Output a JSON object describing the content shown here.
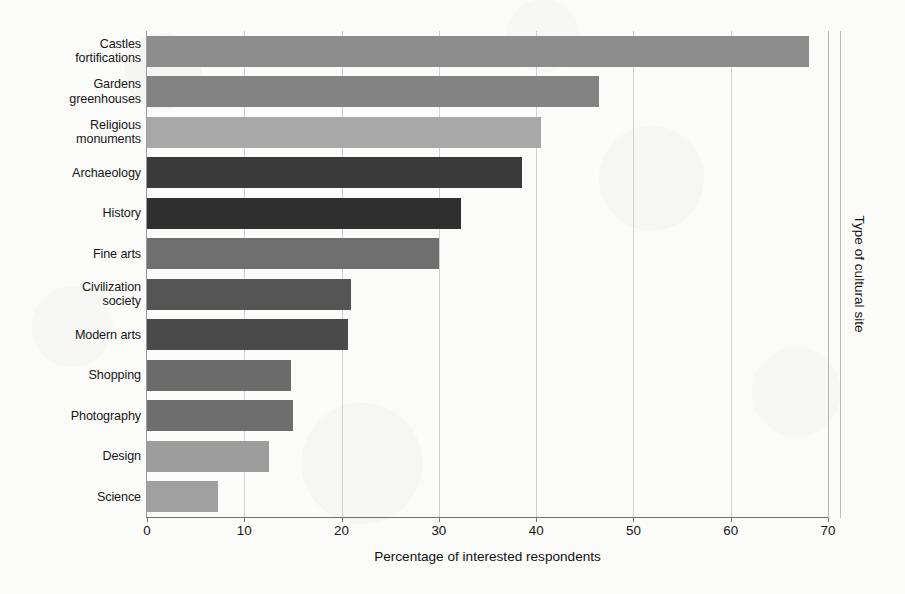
{
  "chart_data": {
    "type": "bar",
    "orientation": "horizontal",
    "title": "",
    "xlabel": "Percentage of interested respondents",
    "ylabel": "Type of cultural site",
    "xlim": [
      0,
      70
    ],
    "xticks": [
      0,
      10,
      20,
      30,
      40,
      50,
      60,
      70
    ],
    "xtick_labels": [
      "0",
      "10",
      "20",
      "30",
      "40",
      "50",
      "60",
      "70"
    ],
    "grid": true,
    "grid_axis": "x",
    "legend": false,
    "categories": [
      "Castles fortifications",
      "Gardens greenhouses",
      "Religious monuments",
      "Archaeology",
      "History",
      "Fine arts",
      "Civilization society",
      "Modern arts",
      "Shopping",
      "Photography",
      "Design",
      "Science"
    ],
    "category_lines": [
      [
        "Castles",
        "fortifications"
      ],
      [
        "Gardens",
        "greenhouses"
      ],
      [
        "Religious",
        "monuments"
      ],
      [
        "Archaeology"
      ],
      [
        "History"
      ],
      [
        "Fine arts"
      ],
      [
        "Civilization",
        "society"
      ],
      [
        "Modern arts"
      ],
      [
        "Shopping"
      ],
      [
        "Photography"
      ],
      [
        "Design"
      ],
      [
        "Science"
      ]
    ],
    "values": [
      68.0,
      46.5,
      40.5,
      38.5,
      32.3,
      30.0,
      21.0,
      20.7,
      14.8,
      15.0,
      12.5,
      7.3
    ],
    "bar_colors": [
      "#8d8d8d",
      "#838383",
      "#a8a8a8",
      "#3a3a3a",
      "#2f2f2f",
      "#6f6f6f",
      "#555555",
      "#4a4a4a",
      "#6b6b6b",
      "#6e6e6e",
      "#9d9d9d",
      "#a0a0a0"
    ]
  },
  "figure": {
    "background_color": "#fbfbfa",
    "axis_color": "#6f6f6f",
    "grid_color": "#cfcfcf",
    "text_color": "#141414"
  }
}
